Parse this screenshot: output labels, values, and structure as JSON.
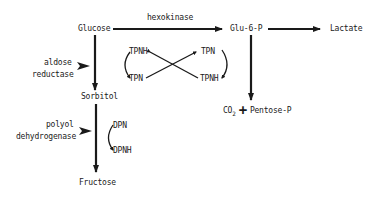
{
  "diagram": {
    "nodes": {
      "glucose": "Glucose",
      "glu6p": "Glu-6-P",
      "lactate": "Lactate",
      "sorbitol": "Sorbitol",
      "fructose": "Fructose",
      "co2_main": "CO",
      "co2_sub": "2",
      "plus": "+",
      "pentose_p": "Pentose-P"
    },
    "enzymes": {
      "hexokinase": "hexokinase",
      "aldose_reductase_line1": "aldose",
      "aldose_reductase_line2": "reductase",
      "polyol_dehydrogenase_line1": "polyol",
      "polyol_dehydrogenase_line2": "dehydrogenase"
    },
    "cofactors": {
      "left_top": "TPNH",
      "left_bottom": "TPN",
      "right_top": "TPN",
      "right_bottom": "TPNH",
      "dpn": "DPN",
      "dpnh": "DPNH"
    },
    "colors": {
      "ink": "#1a1a1a",
      "background": "#ffffff"
    }
  }
}
